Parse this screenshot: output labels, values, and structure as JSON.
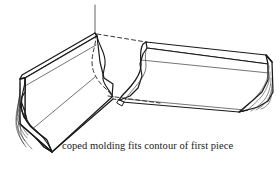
{
  "figure": {
    "caption": "coped molding fits contour of first piece",
    "style": {
      "background": "#ffffff",
      "stroke": "#1a1a1a",
      "stroke_light": "#555555",
      "dash_stroke": "#222222",
      "fill": "#ffffff",
      "stroke_width_outline": 1.5,
      "stroke_width_detail": 0.8,
      "dash_pattern": "4 3"
    },
    "parts": [
      {
        "name": "first-piece",
        "label": "left molding piece",
        "description": "molding running to the left into the corner, square-cut end shown with profiled cross-section and wood grain hatching"
      },
      {
        "name": "second-piece",
        "label": "right molding piece",
        "description": "molding running to the right, coped end at left matching the contour of the first piece, square-cut end at right with wood grain hatching"
      }
    ],
    "annotations": [
      {
        "name": "corner-leader-line",
        "type": "solid-vertical-line",
        "description": "thin vertical line rising from the inside corner apex"
      },
      {
        "name": "hidden-cope-profile",
        "type": "dashed-curve",
        "description": "dashed curve showing the hidden coped contour behind the first piece"
      },
      {
        "name": "hidden-top-edge",
        "type": "dashed-line",
        "description": "dashed line from the corner apex to the top back edge of the second piece"
      },
      {
        "name": "hidden-bottom-edge",
        "type": "dashed-line",
        "description": "dashed line along the hidden bottom back edge of the second piece"
      }
    ]
  }
}
